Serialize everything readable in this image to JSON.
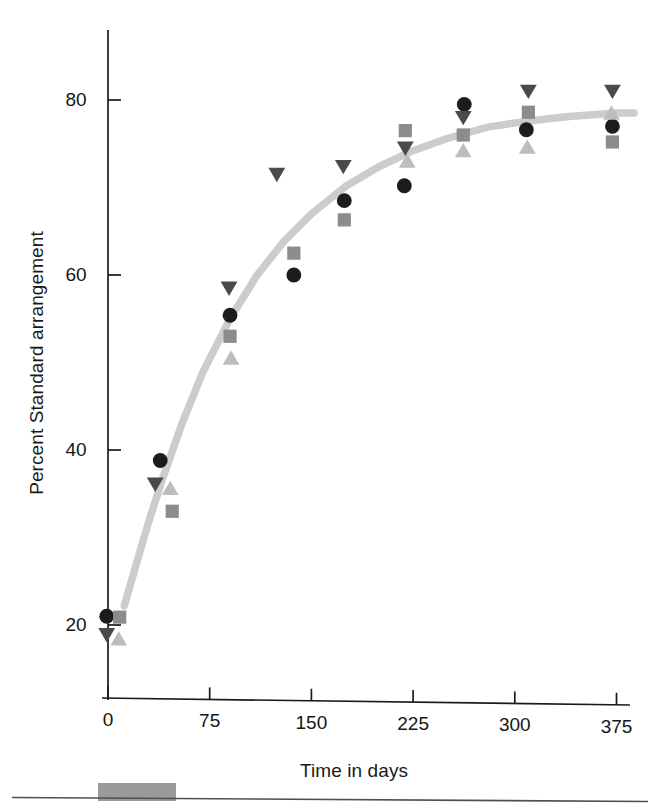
{
  "figure": {
    "background_color": "#ffffff",
    "axis_color": "#1a1a1a",
    "curve_color": "#c9c9c9"
  },
  "chart_data": {
    "type": "scatter",
    "title": "",
    "subtitle": "",
    "xlabel": "Time in days",
    "ylabel": "Percent Standard arrangement",
    "xlim": [
      -8,
      390
    ],
    "ylim": [
      10,
      90
    ],
    "xticks": [
      0,
      75,
      150,
      225,
      300,
      375
    ],
    "xtick_labels": [
      "0",
      "75",
      "150",
      "225",
      "300",
      "375"
    ],
    "yticks": [
      20,
      40,
      60,
      80
    ],
    "ytick_labels": [
      "20",
      "40",
      "60",
      "80"
    ],
    "grid": false,
    "legend": "none",
    "x": [
      2,
      40,
      90,
      140,
      175,
      220,
      262,
      310,
      372
    ],
    "series": [
      {
        "name": "replicate-1",
        "marker": "circle",
        "color": "#1c1c1c",
        "values": [
          21.0,
          38.8,
          55.4,
          60.0,
          68.5,
          70.2,
          79.5,
          76.6,
          77.0
        ]
      },
      {
        "name": "replicate-2",
        "marker": "square",
        "color": "#8c8c8c",
        "values": [
          20.9,
          33.0,
          53.0,
          62.5,
          66.3,
          76.5,
          76.0,
          78.6,
          75.2
        ]
      },
      {
        "name": "replicate-3",
        "marker": "triangle-down",
        "color": "#4a4a4a",
        "values": [
          18.9,
          36.1,
          58.5,
          71.5,
          72.4,
          74.5,
          78.0,
          81.0,
          81.0
        ]
      },
      {
        "name": "replicate-4",
        "marker": "triangle-up",
        "color": "#bdbdbd",
        "values": [
          18.4,
          35.6,
          50.5,
          null,
          null,
          73.0,
          74.2,
          74.6,
          78.5
        ]
      }
    ],
    "fit_curve": {
      "name": "fitted-logistic-curve",
      "color": "#cccccc",
      "x": [
        12,
        20,
        30,
        40,
        55,
        70,
        90,
        110,
        130,
        150,
        175,
        200,
        225,
        250,
        280,
        310,
        340,
        375,
        388
      ],
      "y": [
        22.2,
        26.5,
        31.8,
        36.6,
        43.2,
        48.9,
        55.0,
        60.0,
        63.9,
        67.0,
        70.1,
        72.4,
        74.2,
        75.6,
        76.9,
        77.6,
        78.1,
        78.5,
        78.5
      ]
    },
    "annotations": []
  },
  "scan_artifact": {
    "name": "page-edge-artifact",
    "line_color": "#4f4f4f",
    "block_color": "#9a9a9a"
  }
}
